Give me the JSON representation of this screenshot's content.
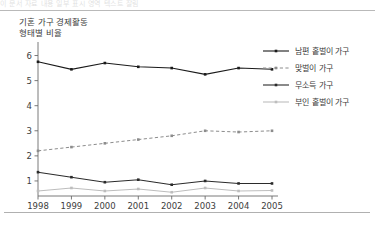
{
  "page": {
    "top_band_text": "이 문서 자료 내용 일부 표시 영역 텍스트 잘림",
    "title_line1": "기혼 가구 경제활동",
    "title_line2": "형태별 비율"
  },
  "colors": {
    "husband_only": "#1a1a1a",
    "dual_income": "#8c8c8c",
    "no_income": "#2b2b2b",
    "wife_only": "#bdbdbd",
    "axis": "#6b6b6b",
    "text": "#3d3d3d"
  },
  "legend": {
    "items": [
      {
        "label": "남편 홑벌이 가구",
        "style": "solid",
        "color": "#1a1a1a"
      },
      {
        "label": "맞벌이 가구",
        "style": "dashed",
        "color": "#8c8c8c"
      },
      {
        "label": "무소득 가구",
        "style": "solid",
        "color": "#2b2b2b"
      },
      {
        "label": "부인 홑벌이 가구",
        "style": "solid",
        "color": "#bdbdbd"
      }
    ]
  },
  "chart_data": {
    "type": "line",
    "title": "기혼 가구 경제활동 형태별 비율",
    "xlabel": "",
    "ylabel": "",
    "x": [
      "1998",
      "1999",
      "2000",
      "2001",
      "2002",
      "2003",
      "2004",
      "2005"
    ],
    "xlim": [
      1998,
      2005
    ],
    "ylim": [
      0.4,
      6.3
    ],
    "yticks": [
      1,
      2,
      3,
      4,
      5,
      6
    ],
    "grid": false,
    "legend_position": "right",
    "series": [
      {
        "name": "남편 홑벌이 가구",
        "style": "solid",
        "color": "#1a1a1a",
        "marker": "square",
        "values": [
          5.75,
          5.45,
          5.7,
          5.55,
          5.5,
          5.25,
          5.5,
          5.45
        ]
      },
      {
        "name": "맞벌이 가구",
        "style": "dashed",
        "color": "#8c8c8c",
        "marker": "square",
        "values": [
          2.2,
          2.35,
          2.5,
          2.65,
          2.8,
          3.0,
          2.95,
          3.0
        ]
      },
      {
        "name": "무소득 가구",
        "style": "solid",
        "color": "#2b2b2b",
        "marker": "square",
        "values": [
          1.35,
          1.15,
          0.95,
          1.05,
          0.85,
          1.0,
          0.9,
          0.9
        ]
      },
      {
        "name": "부인 홑벌이 가구",
        "style": "solid",
        "color": "#bdbdbd",
        "marker": "square",
        "values": [
          0.6,
          0.72,
          0.6,
          0.68,
          0.55,
          0.72,
          0.6,
          0.62
        ]
      }
    ]
  }
}
